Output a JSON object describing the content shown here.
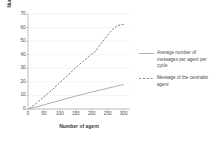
{
  "chart_data": {
    "type": "line",
    "title": "",
    "xlabel": "Number of agent",
    "ylabel": "Number of message",
    "xlim": [
      0,
      320
    ],
    "ylim": [
      0,
      70
    ],
    "xticks": [
      0,
      50,
      100,
      150,
      200,
      250,
      300
    ],
    "yticks": [
      0,
      10,
      20,
      30,
      40,
      50,
      60,
      70
    ],
    "grid": true,
    "grid_axis": "y",
    "legend_position": "right",
    "series": [
      {
        "name": "Average number of messages per agent per cycle",
        "style": "solid",
        "color": "#8c8c8c",
        "x": [
          5,
          25,
          50,
          75,
          100,
          125,
          150,
          175,
          200,
          225,
          250,
          275,
          300
        ],
        "values": [
          0.3,
          1.5,
          3.1,
          4.7,
          6.3,
          7.9,
          9.5,
          11.0,
          12.5,
          13.9,
          15.3,
          16.7,
          18.0
        ]
      },
      {
        "name": "Message of the centralist agent",
        "style": "dashed",
        "color": "#6e6e6e",
        "x": [
          5,
          25,
          50,
          75,
          100,
          125,
          150,
          175,
          200,
          210,
          225,
          250,
          265,
          280,
          300
        ],
        "values": [
          0.3,
          4.0,
          9.0,
          14.0,
          19.5,
          25.0,
          30.5,
          35.5,
          40.5,
          42.0,
          47.0,
          54.5,
          58.5,
          61.5,
          62.3
        ]
      }
    ]
  },
  "legend": {
    "items": [
      {
        "label": "Average number of messages per agent per cycle",
        "style": "solid"
      },
      {
        "label": "Message of the centralist agent",
        "style": "dashed"
      }
    ]
  },
  "axes": {
    "x_title": "Number of agent",
    "y_title": "Number of message",
    "x_tick_labels": [
      "0",
      "50",
      "100",
      "150",
      "200",
      "250",
      "300"
    ],
    "y_tick_labels": [
      "0",
      "10",
      "20",
      "30",
      "40",
      "50",
      "60",
      "70"
    ]
  },
  "colors": {
    "background": "#ffffff",
    "grid": "#e9e9e9",
    "axis": "#9a9a9a",
    "series_solid": "#8c8c8c",
    "series_dashed": "#6e6e6e",
    "text": "#4a4a4a"
  }
}
